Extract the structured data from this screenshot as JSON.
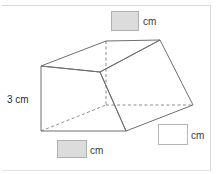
{
  "figure": {
    "type": "triangular-prism-diagram",
    "known_dimension": {
      "label": "3 cm",
      "value": 3,
      "unit": "cm",
      "position": "left-vertical-edge"
    },
    "unknown_dimensions": [
      {
        "id": "top",
        "unit": "cm",
        "value": "",
        "box_style": "filled",
        "position": "top"
      },
      {
        "id": "bottom",
        "unit": "cm",
        "value": "",
        "box_style": "filled",
        "position": "bottom"
      },
      {
        "id": "right",
        "unit": "cm",
        "value": "",
        "box_style": "empty",
        "position": "right"
      }
    ],
    "colors": {
      "solid_edge": "#6e6e6e",
      "hidden_edge": "#8c8c8c",
      "filled_box": "#dcdcdc",
      "box_border": "#b9b9b9",
      "frame": "#d8d8d8",
      "text": "#2e2e2e",
      "background": "#ffffff"
    },
    "geometry": {
      "vertices": {
        "front_top_left": [
          41,
          66
        ],
        "front_bottom_left": [
          41,
          131
        ],
        "front_bottom_right": [
          126,
          131
        ],
        "front_mid_right": [
          100,
          72
        ],
        "top_apex": [
          106,
          41
        ],
        "top_right": [
          160,
          40
        ],
        "far_right": [
          193,
          105
        ],
        "hidden_bottom": [
          106,
          105
        ]
      },
      "hidden_edges": [
        "top_apex-hidden_bottom",
        "hidden_bottom-far_right",
        "front_bottom_left-hidden_bottom"
      ]
    }
  }
}
